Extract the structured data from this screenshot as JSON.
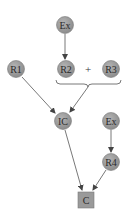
{
  "diagram": {
    "type": "flow",
    "colors": {
      "node_fill": "#9a9a9a",
      "node_stroke": "#7a7a7a",
      "edge": "#555555",
      "text": "#2a2a2a",
      "background": "#ffffff"
    },
    "nodes": [
      {
        "id": "ex_top",
        "label": "Ex",
        "shape": "circle",
        "cx": 65,
        "cy": 25
      },
      {
        "id": "r1",
        "label": "R1",
        "shape": "circle",
        "cx": 16,
        "cy": 69
      },
      {
        "id": "r2",
        "label": "R2",
        "shape": "circle",
        "cx": 66,
        "cy": 69
      },
      {
        "id": "r3",
        "label": "R3",
        "shape": "circle",
        "cx": 111,
        "cy": 69
      },
      {
        "id": "ic",
        "label": "IC",
        "shape": "circle",
        "cx": 63,
        "cy": 121
      },
      {
        "id": "ex_right",
        "label": "Ex",
        "shape": "circle",
        "cx": 111,
        "cy": 121
      },
      {
        "id": "r4",
        "label": "R4",
        "shape": "circle",
        "cx": 111,
        "cy": 162
      },
      {
        "id": "c",
        "label": "C",
        "shape": "square",
        "cx": 86,
        "cy": 200
      }
    ],
    "operator": {
      "label": "+",
      "x": 88,
      "y": 69
    },
    "group": {
      "label": "R2 + R3",
      "members": [
        "r2",
        "r3"
      ]
    },
    "edges": [
      {
        "from": "ex_top",
        "to": "r2"
      },
      {
        "from": "r1",
        "to": "ic"
      },
      {
        "from": "r2+r3",
        "to": "ic"
      },
      {
        "from": "ic",
        "to": "c"
      },
      {
        "from": "ex_right",
        "to": "r4"
      },
      {
        "from": "r4",
        "to": "c"
      }
    ]
  }
}
